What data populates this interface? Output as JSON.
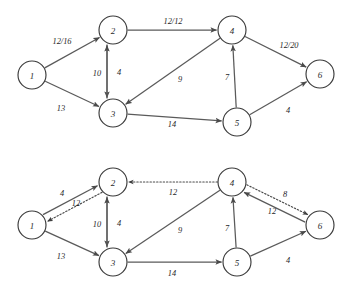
{
  "figure": {
    "node_radius": 14,
    "colors": {
      "node_stroke": "#3a3a3a",
      "edge_solid": "#5a5a5a",
      "edge_dotted": "#4a4a4a",
      "text": "#1f1f1f",
      "background": "#ffffff"
    }
  },
  "diagrams": [
    {
      "id": "flow-network",
      "name": "flow-network-top",
      "nodes": [
        {
          "id": "n1",
          "label": "1",
          "x": 32,
          "y": 75
        },
        {
          "id": "n2",
          "label": "2",
          "x": 113,
          "y": 30
        },
        {
          "id": "n3",
          "label": "3",
          "x": 113,
          "y": 113
        },
        {
          "id": "n4",
          "label": "4",
          "x": 232,
          "y": 30
        },
        {
          "id": "n5",
          "label": "5",
          "x": 237,
          "y": 122
        },
        {
          "id": "n6",
          "label": "6",
          "x": 320,
          "y": 74
        }
      ],
      "edges": [
        {
          "id": "e1-2",
          "from": "n1",
          "to": "n2",
          "label": "12/16",
          "style": "solid",
          "lx": 62,
          "ly": 41
        },
        {
          "id": "e1-3",
          "from": "n1",
          "to": "n3",
          "label": "13",
          "style": "solid",
          "lx": 61,
          "ly": 108
        },
        {
          "id": "e2-4",
          "from": "n2",
          "to": "n4",
          "label": "12/12",
          "style": "solid",
          "lx": 173,
          "ly": 21
        },
        {
          "id": "e2-3",
          "from": "n2",
          "to": "n3",
          "label": "4",
          "style": "solid",
          "lx": 119,
          "ly": 72,
          "offset": 6
        },
        {
          "id": "e3-2",
          "from": "n3",
          "to": "n2",
          "label": "10",
          "style": "solid",
          "lx": 97,
          "ly": 73,
          "offset": -6
        },
        {
          "id": "e4-3",
          "from": "n4",
          "to": "n3",
          "label": "9",
          "style": "solid",
          "lx": 180,
          "ly": 79
        },
        {
          "id": "e3-5",
          "from": "n3",
          "to": "n5",
          "label": "14",
          "style": "solid",
          "lx": 172,
          "ly": 124
        },
        {
          "id": "e5-4",
          "from": "n5",
          "to": "n4",
          "label": "7",
          "style": "solid",
          "lx": 227,
          "ly": 77
        },
        {
          "id": "e4-6",
          "from": "n4",
          "to": "n6",
          "label": "12/20",
          "style": "solid",
          "lx": 289,
          "ly": 45
        },
        {
          "id": "e5-6",
          "from": "n5",
          "to": "n6",
          "label": "4",
          "style": "solid",
          "lx": 288,
          "ly": 110
        }
      ]
    },
    {
      "id": "residual-network",
      "name": "residual-network-bottom",
      "nodes": [
        {
          "id": "m1",
          "label": "1",
          "x": 32,
          "y": 225
        },
        {
          "id": "m2",
          "label": "2",
          "x": 113,
          "y": 182
        },
        {
          "id": "m3",
          "label": "3",
          "x": 113,
          "y": 262
        },
        {
          "id": "m4",
          "label": "4",
          "x": 232,
          "y": 182
        },
        {
          "id": "m5",
          "label": "5",
          "x": 237,
          "y": 262
        },
        {
          "id": "m6",
          "label": "6",
          "x": 320,
          "y": 225
        }
      ],
      "edges": [
        {
          "id": "r1-2",
          "from": "m1",
          "to": "m2",
          "label": "4",
          "style": "solid",
          "lx": 62,
          "ly": 193,
          "offset": -4
        },
        {
          "id": "r2-1",
          "from": "m2",
          "to": "m1",
          "label": "12",
          "style": "dotted",
          "lx": 76,
          "ly": 203,
          "offset": -4
        },
        {
          "id": "r1-3",
          "from": "m1",
          "to": "m3",
          "label": "13",
          "style": "solid",
          "lx": 61,
          "ly": 256
        },
        {
          "id": "r4-2",
          "from": "m4",
          "to": "m2",
          "label": "12",
          "style": "dotted",
          "lx": 173,
          "ly": 192
        },
        {
          "id": "r2-3",
          "from": "m2",
          "to": "m3",
          "label": "4",
          "style": "solid",
          "lx": 119,
          "ly": 223,
          "offset": 6
        },
        {
          "id": "r3-2",
          "from": "m3",
          "to": "m2",
          "label": "10",
          "style": "solid",
          "lx": 97,
          "ly": 224,
          "offset": -6
        },
        {
          "id": "r4-3",
          "from": "m4",
          "to": "m3",
          "label": "9",
          "style": "solid",
          "lx": 180,
          "ly": 230
        },
        {
          "id": "r3-5",
          "from": "m3",
          "to": "m5",
          "label": "14",
          "style": "solid",
          "lx": 172,
          "ly": 273
        },
        {
          "id": "r5-4",
          "from": "m5",
          "to": "m4",
          "label": "7",
          "style": "solid",
          "lx": 227,
          "ly": 228
        },
        {
          "id": "r6-4",
          "from": "m6",
          "to": "m4",
          "label": "8",
          "style": "solid",
          "lx": 285,
          "ly": 194,
          "offset": -4
        },
        {
          "id": "r4-6",
          "from": "m4",
          "to": "m6",
          "label": "12",
          "style": "dotted",
          "lx": 272,
          "ly": 211,
          "offset": -4
        },
        {
          "id": "r5-6",
          "from": "m5",
          "to": "m6",
          "label": "4",
          "style": "solid",
          "lx": 288,
          "ly": 260
        }
      ]
    }
  ]
}
